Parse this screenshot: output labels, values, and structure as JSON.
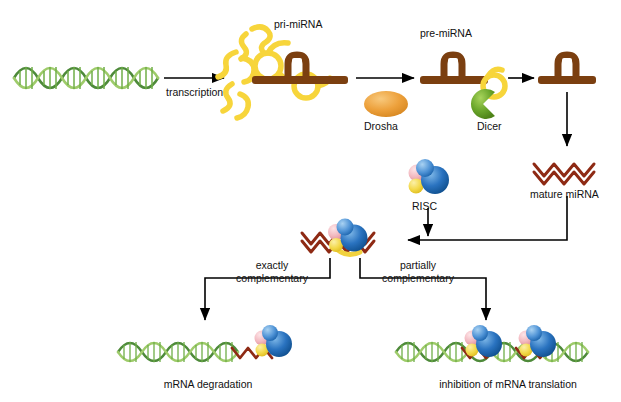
{
  "figure": {
    "title": "",
    "type": "miRNA biogenesis pathway diagram",
    "background": "#ffffff"
  },
  "labels": {
    "transcription": "transcription",
    "pri_mirna": "pri-miRNA",
    "pre_mirna": "pre-miRNA",
    "drosha": "Drosha",
    "dicer": "Dicer",
    "mature_mirna": "mature miRNA",
    "risc": "RISC",
    "exactly_complementary_l1": "exactly",
    "exactly_complementary_l2": "complementary",
    "partially_complementary_l1": "partially",
    "partially_complementary_l2": "complementary",
    "mrna_degradation": "mRNA degradation",
    "inhibition": "inhibition of mRNA translation"
  },
  "colors": {
    "dna_green_dark": "#4e8a3a",
    "dna_green_light": "#9ecb6a",
    "pri_mirna_yellow": "#f7d53b",
    "hairpin_brown": "#7b3f10",
    "mirna_red": "#8e2a14",
    "drosha_orange": "#eda13c",
    "dicer_green": "#6aa62b",
    "risc_blue": "#1b63b5",
    "risc_blue_light": "#6aa9e0",
    "risc_pink": "#f0b6bd",
    "risc_yellow": "#f2d23e",
    "arrow_black": "#000000"
  },
  "elements": [
    {
      "name": "dna-duplex",
      "kind": "double-helix",
      "color": "#4e8a3a"
    },
    {
      "name": "pri-mirna-transcript",
      "kind": "folded-rna",
      "color": "#f7d53b"
    },
    {
      "name": "pri-mirna-hairpin",
      "kind": "hairpin-on-strand",
      "color": "#7b3f10"
    },
    {
      "name": "drosha-enzyme",
      "kind": "ellipse",
      "color": "#eda13c"
    },
    {
      "name": "pre-mirna-hairpin",
      "kind": "hairpin-on-strand",
      "color": "#7b3f10"
    },
    {
      "name": "dicer-enzyme",
      "kind": "pacman",
      "color": "#6aa62b"
    },
    {
      "name": "cut-hairpin",
      "kind": "hairpin-on-strand",
      "color": "#7b3f10"
    },
    {
      "name": "mature-mirna-duplex",
      "kind": "zigzag-duplex",
      "color": "#8e2a14"
    },
    {
      "name": "risc-complex",
      "kind": "protein-cluster",
      "color": "#1b63b5"
    },
    {
      "name": "risc-loaded-mirna",
      "kind": "risc-on-mirna",
      "color": "#1b63b5"
    },
    {
      "name": "mrna-target-exact",
      "kind": "mrna-with-risc",
      "color": "#4e8a3a"
    },
    {
      "name": "mrna-target-partial",
      "kind": "mrna-with-risc",
      "color": "#4e8a3a"
    }
  ],
  "arrows": [
    {
      "name": "arrow-transcription",
      "from": "dna-duplex",
      "to": "pri-mirna"
    },
    {
      "name": "arrow-drosha",
      "from": "pri-mirna",
      "to": "pre-mirna"
    },
    {
      "name": "arrow-dicer",
      "from": "pre-mirna",
      "to": "cut-hairpin"
    },
    {
      "name": "arrow-to-mature",
      "from": "cut-hairpin",
      "to": "mature-mirna"
    },
    {
      "name": "arrow-mature-to-risc-loaded",
      "from": "mature-mirna",
      "to": "risc-loaded-mirna"
    },
    {
      "name": "arrow-risc-join",
      "from": "risc-complex",
      "to": "risc-loaded-mirna"
    },
    {
      "name": "arrow-exactly-complementary",
      "from": "risc-loaded-mirna",
      "to": "mrna-degradation"
    },
    {
      "name": "arrow-partially-complementary",
      "from": "risc-loaded-mirna",
      "to": "inhibition-of-translation"
    }
  ]
}
